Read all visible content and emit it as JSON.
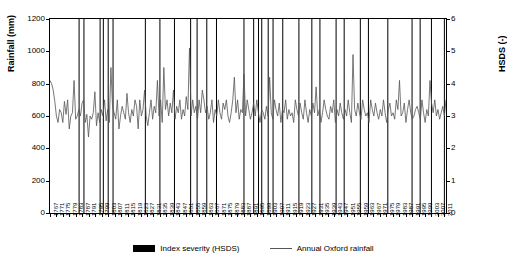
{
  "chart_data": {
    "type": "line",
    "title": "",
    "xlabel": "",
    "ylabel_left": "Rainfall (mm)",
    "ylabel_right": "HSDS (-)",
    "ylim_left": [
      0,
      1200
    ],
    "ylim_right": [
      0,
      6
    ],
    "yticks_left": [
      "0",
      "200",
      "400",
      "600",
      "800",
      "1000",
      "1200"
    ],
    "yticks_right": [
      "0",
      "1",
      "2",
      "3",
      "4",
      "5",
      "6"
    ],
    "grid": false,
    "legend_position": "bottom",
    "legend": [
      {
        "label": "Index severity (HSDS)",
        "type": "bar",
        "color": "#000000"
      },
      {
        "label": "Annual Oxford rainfall",
        "type": "line",
        "color": "#555555"
      }
    ],
    "xticks": [
      "1767",
      "1771",
      "1775",
      "1779",
      "1783",
      "1787",
      "1791",
      "1795",
      "1799",
      "1803",
      "1807",
      "1811",
      "1815",
      "1819",
      "1823",
      "1827",
      "1831",
      "1835",
      "1839",
      "1843",
      "1847",
      "1851",
      "1855",
      "1859",
      "1863",
      "1867",
      "1871",
      "1875",
      "1879",
      "1883",
      "1887",
      "1891",
      "1895",
      "1899",
      "1903",
      "1907",
      "1911",
      "1915",
      "1919",
      "1923",
      "1927",
      "1931",
      "1935",
      "1939",
      "1943",
      "1947",
      "1951",
      "1955",
      "1959",
      "1963",
      "1967",
      "1971",
      "1975",
      "1979",
      "1983",
      "1987",
      "1991",
      "1995",
      "1999",
      "2003",
      "2007",
      "2011"
    ],
    "x_start": 1767,
    "x_end": 2012,
    "series": [
      {
        "name": "Annual Oxford rainfall",
        "color": "#555555",
        "unit": "mm",
        "axis": "left",
        "values": [
          820,
          800,
          760,
          690,
          600,
          560,
          640,
          620,
          560,
          690,
          610,
          700,
          520,
          600,
          620,
          820,
          580,
          600,
          640,
          600,
          680,
          700,
          560,
          610,
          470,
          600,
          580,
          620,
          750,
          540,
          620,
          560,
          640,
          600,
          700,
          570,
          640,
          560,
          900,
          660,
          620,
          580,
          700,
          520,
          600,
          660,
          620,
          580,
          740,
          620,
          560,
          640,
          600,
          700,
          660,
          520,
          700,
          600,
          640,
          760,
          600,
          540,
          620,
          700,
          580,
          660,
          620,
          820,
          600,
          700,
          560,
          900,
          640,
          700,
          600,
          680,
          620,
          760,
          580,
          660,
          620,
          700,
          580,
          640,
          600,
          720,
          640,
          1020,
          600,
          700,
          620,
          660,
          580,
          700,
          620,
          760,
          700,
          620,
          660,
          580,
          620,
          700,
          560,
          640,
          600,
          700,
          620,
          580,
          680,
          640,
          700,
          600,
          560,
          620,
          700,
          840,
          620,
          700,
          580,
          640,
          620,
          860,
          600,
          700,
          640,
          580,
          620,
          680,
          600,
          700,
          620,
          560,
          640,
          620,
          580,
          660,
          600,
          840,
          620,
          580,
          700,
          640,
          600,
          680,
          560,
          640,
          620,
          700,
          580,
          640,
          600,
          620,
          560,
          700,
          640,
          600,
          680,
          620,
          580,
          700,
          620,
          560,
          640,
          600,
          680,
          620,
          780,
          600,
          640,
          560,
          620,
          700,
          640,
          600,
          580,
          660,
          620,
          700,
          560,
          640,
          600,
          680,
          620,
          580,
          640,
          600,
          700,
          620,
          560,
          980,
          640,
          600,
          680,
          620,
          580,
          700,
          640,
          600,
          620,
          560,
          700,
          640,
          600,
          680,
          620,
          580,
          640,
          600,
          700,
          620,
          560,
          640,
          680,
          600,
          620,
          580,
          700,
          640,
          820,
          600,
          620,
          680,
          560,
          640,
          700,
          620,
          580,
          600,
          640,
          660,
          620,
          580,
          700,
          620,
          560,
          640,
          600,
          820,
          680,
          620,
          700,
          600,
          640,
          580,
          620,
          660,
          600,
          700
        ]
      },
      {
        "name": "Index severity (HSDS)",
        "color": "#000000",
        "unit": "HSDS",
        "axis": "right",
        "note": "vertical spikes at drought years",
        "points": [
          {
            "year": 1785,
            "value": 6.0
          },
          {
            "year": 1788,
            "value": 6.0
          },
          {
            "year": 1798,
            "value": 6.0
          },
          {
            "year": 1800,
            "value": 6.0
          },
          {
            "year": 1803,
            "value": 6.0
          },
          {
            "year": 1806,
            "value": 6.0
          },
          {
            "year": 1826,
            "value": 6.0
          },
          {
            "year": 1835,
            "value": 6.0
          },
          {
            "year": 1844,
            "value": 6.0
          },
          {
            "year": 1854,
            "value": 6.0
          },
          {
            "year": 1858,
            "value": 6.0
          },
          {
            "year": 1864,
            "value": 6.0
          },
          {
            "year": 1870,
            "value": 6.0
          },
          {
            "year": 1887,
            "value": 6.0
          },
          {
            "year": 1893,
            "value": 6.0
          },
          {
            "year": 1896,
            "value": 6.0
          },
          {
            "year": 1898,
            "value": 6.0
          },
          {
            "year": 1902,
            "value": 6.0
          },
          {
            "year": 1905,
            "value": 6.0
          },
          {
            "year": 1911,
            "value": 6.0
          },
          {
            "year": 1921,
            "value": 6.0
          },
          {
            "year": 1929,
            "value": 6.0
          },
          {
            "year": 1934,
            "value": 6.0
          },
          {
            "year": 1944,
            "value": 6.0
          },
          {
            "year": 1949,
            "value": 6.0
          },
          {
            "year": 1959,
            "value": 6.0
          },
          {
            "year": 1964,
            "value": 6.0
          },
          {
            "year": 1976,
            "value": 6.0
          },
          {
            "year": 1991,
            "value": 6.0
          },
          {
            "year": 1996,
            "value": 6.0
          },
          {
            "year": 2003,
            "value": 6.0
          },
          {
            "year": 2011,
            "value": 6.0
          }
        ]
      }
    ]
  }
}
